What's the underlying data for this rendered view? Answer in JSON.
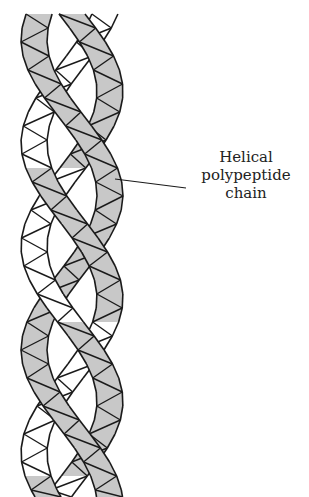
{
  "figure": {
    "ribbon_fill_shaded": "#c8c8c8",
    "ribbon_fill_plain": "#ffffff",
    "stroke_color": "#1a1a1a"
  },
  "annotation": {
    "lines": [
      "Helical",
      "polypeptide",
      "chain"
    ],
    "leader_from": [
      115,
      179
    ],
    "leader_to": [
      186,
      188
    ]
  }
}
